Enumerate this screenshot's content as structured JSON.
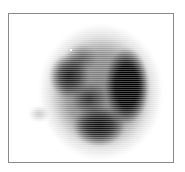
{
  "image": {
    "description": "Grayscale scintigraphic scan showing an irregular dark rounded mass with heavier density on the right side, rendered with horizontal scanline texture inside a thin gray frame",
    "colors": {
      "background": "#ffffff",
      "frame": "#8a8a8a",
      "uptake_dark": "#000000",
      "caption": "#c8c8c8"
    }
  },
  "caption": {
    "text": ""
  }
}
